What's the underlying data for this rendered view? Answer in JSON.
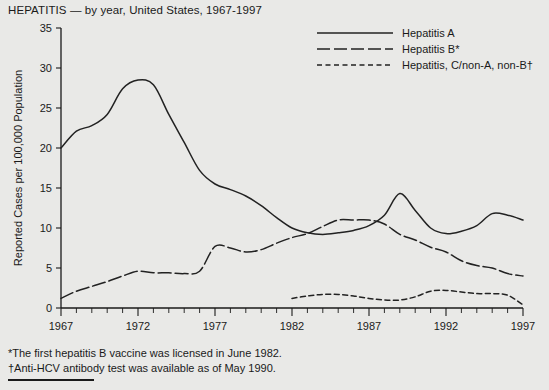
{
  "chart_title": "HEPATITIS — by year, United States, 1967-1997",
  "footnotes": [
    "*The first hepatitis B vaccine was licensed in June 1982.",
    "†Anti-HCV antibody test was available as of May 1990."
  ],
  "legend": {
    "position": "top-right",
    "entries": [
      {
        "label": "Hepatitis A",
        "style": "solid"
      },
      {
        "label": "Hepatitis B*",
        "style": "long-dash"
      },
      {
        "label": "Hepatitis, C/non-A, non-B†",
        "style": "short-dash"
      }
    ]
  },
  "chart_data": {
    "type": "line",
    "title": "HEPATITIS — by year, United States, 1967-1997",
    "subtitle": "",
    "xlabel": "Year",
    "ylabel": "Reported Cases per 100,000 Population",
    "xlim": [
      1967,
      1997
    ],
    "ylim": [
      0,
      35
    ],
    "xticks": [
      1967,
      1972,
      1977,
      1982,
      1987,
      1992,
      1997
    ],
    "xtick_labels": [
      "1967",
      "1972",
      "1977",
      "1982",
      "1987",
      "1992",
      "1997"
    ],
    "yticks": [
      0,
      5,
      10,
      15,
      20,
      25,
      30,
      35
    ],
    "ytick_labels": [
      "0",
      "5",
      "10",
      "15",
      "20",
      "25",
      "30",
      "35"
    ],
    "minor_xticks_interval": 1,
    "grid": false,
    "legend_position": "top-right",
    "x": [
      1967,
      1968,
      1969,
      1970,
      1971,
      1972,
      1973,
      1974,
      1975,
      1976,
      1977,
      1978,
      1979,
      1980,
      1981,
      1982,
      1983,
      1984,
      1985,
      1986,
      1987,
      1988,
      1989,
      1990,
      1991,
      1992,
      1993,
      1994,
      1995,
      1996,
      1997
    ],
    "series": [
      {
        "name": "Hepatitis A",
        "style": "solid",
        "color": "#222222",
        "values": [
          20.0,
          22.1,
          22.8,
          24.2,
          27.4,
          28.5,
          27.9,
          24.2,
          20.7,
          17.2,
          15.5,
          14.8,
          14.0,
          12.8,
          11.3,
          10.0,
          9.4,
          9.2,
          9.4,
          9.7,
          10.3,
          11.6,
          14.3,
          12.2,
          10.0,
          9.3,
          9.6,
          10.3,
          11.8,
          11.6,
          11.0
        ]
      },
      {
        "name": "Hepatitis B*",
        "style": "long-dash",
        "color": "#222222",
        "values": [
          1.2,
          2.1,
          2.7,
          3.3,
          4.0,
          4.6,
          4.4,
          4.4,
          4.3,
          4.6,
          7.7,
          7.5,
          7.0,
          7.3,
          8.1,
          8.8,
          9.3,
          10.2,
          11.0,
          11.0,
          11.0,
          10.5,
          9.2,
          8.5,
          7.6,
          7.0,
          5.9,
          5.3,
          5.0,
          4.3,
          4.0
        ]
      },
      {
        "name": "Hepatitis, C/non-A, non-B†",
        "style": "short-dash",
        "color": "#222222",
        "values": [
          null,
          null,
          null,
          null,
          null,
          null,
          null,
          null,
          null,
          null,
          null,
          null,
          null,
          null,
          null,
          1.2,
          1.5,
          1.7,
          1.7,
          1.5,
          1.2,
          1.0,
          1.0,
          1.4,
          2.1,
          2.2,
          2.0,
          1.8,
          1.8,
          1.6,
          0.4
        ]
      }
    ]
  }
}
